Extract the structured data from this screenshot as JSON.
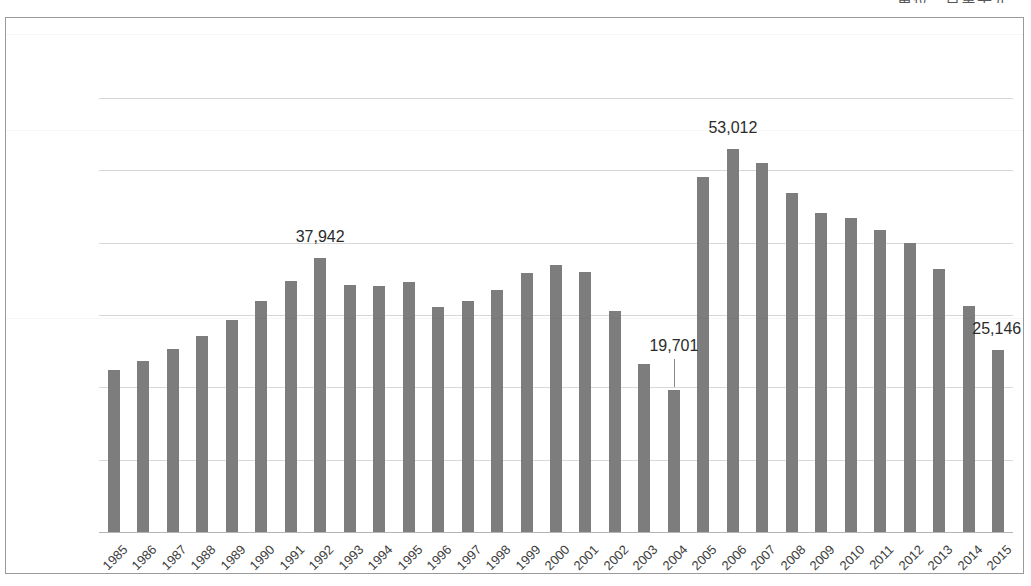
{
  "unit_caption": "單位：百萬美元",
  "chart_data": {
    "type": "bar",
    "title": "",
    "subtitle": "",
    "xlabel": "",
    "ylabel": "",
    "unit_note": "單位：百萬美元",
    "grid": true,
    "legend": "none",
    "ylim": [
      0,
      60000
    ],
    "ytick_labels": [
      "60,000",
      "50,000",
      "40,000",
      "30,000",
      "20,000",
      "10,000",
      "0"
    ],
    "ytick_values": [
      60000,
      50000,
      40000,
      30000,
      20000,
      10000,
      0
    ],
    "bar_color": "#7d7d7d",
    "categories": [
      "1985",
      "1986",
      "1987",
      "1988",
      "1989",
      "1990",
      "1991",
      "1992",
      "1993",
      "1994",
      "1995",
      "1996",
      "1997",
      "1998",
      "1999",
      "2000",
      "2001",
      "2002",
      "2003",
      "2004",
      "2005",
      "2006",
      "2007",
      "2008",
      "2009",
      "2010",
      "2011",
      "2012",
      "2013",
      "2014",
      "2015"
    ],
    "values": [
      22330,
      23670,
      25350,
      27080,
      29280,
      31970,
      34650,
      37942,
      34170,
      34070,
      34560,
      31100,
      31870,
      33400,
      35800,
      36860,
      36000,
      30500,
      23200,
      19701,
      49050,
      53012,
      50950,
      46800,
      44050,
      43430,
      41750,
      39930,
      36370,
      31190,
      25146
    ],
    "annotations": [
      {
        "category": "1992",
        "label": "37,942",
        "value": 37942,
        "leader": false
      },
      {
        "category": "2004",
        "label": "19,701",
        "value": 19701,
        "leader": true
      },
      {
        "category": "2006",
        "label": "53,012",
        "value": 53012,
        "leader": false
      },
      {
        "category": "2015",
        "label": "25,146",
        "value": 25146,
        "leader": false
      }
    ]
  }
}
